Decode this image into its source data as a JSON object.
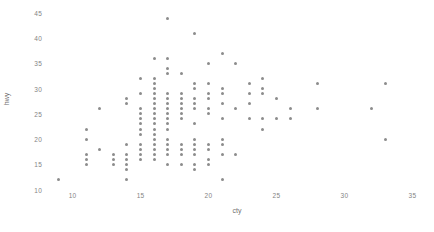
{
  "chart_data": {
    "type": "scatter",
    "title": "",
    "xlabel": "cty",
    "ylabel": "hwy",
    "xlim": [
      8.2,
      36.0
    ],
    "ylim": [
      10.3,
      45.6
    ],
    "xticks": [
      10,
      15,
      20,
      25,
      30,
      35
    ],
    "yticks": [
      10,
      15,
      20,
      25,
      30,
      35,
      40,
      45
    ],
    "xtick_labels": [
      "10",
      "15",
      "20",
      "25",
      "30",
      "35"
    ],
    "ytick_labels": [
      "10",
      "15",
      "20",
      "25",
      "30",
      "35",
      "40",
      "45"
    ],
    "grid": false,
    "legend": "none",
    "point_color": "#8c8c8c",
    "background": "#ffffff",
    "x": [
      18,
      21,
      20,
      21,
      16,
      18,
      18,
      18,
      16,
      20,
      19,
      15,
      17,
      17,
      15,
      15,
      17,
      16,
      14,
      11,
      14,
      13,
      12,
      16,
      15,
      16,
      15,
      15,
      14,
      11,
      11,
      14,
      19,
      22,
      18,
      18,
      17,
      18,
      17,
      16,
      16,
      17,
      17,
      11,
      15,
      15,
      16,
      16,
      15,
      14,
      13,
      14,
      14,
      9,
      11,
      17,
      16,
      14,
      14,
      11,
      11,
      12,
      14,
      15,
      14,
      13,
      13,
      14,
      14,
      13,
      13,
      13,
      11,
      13,
      18,
      17,
      21,
      19,
      19,
      19,
      14,
      15,
      17,
      16,
      16,
      15,
      17,
      26,
      20,
      18,
      16,
      16,
      15,
      19,
      17,
      17,
      17,
      16,
      16,
      17,
      15,
      17,
      16,
      17,
      17,
      18,
      17,
      16,
      16,
      15,
      15,
      14,
      28,
      24,
      25,
      23,
      24,
      26,
      25,
      24,
      21,
      21,
      21,
      21,
      18,
      18,
      19,
      19,
      19,
      20,
      20,
      19,
      20,
      17,
      16,
      17,
      17,
      15,
      15,
      14,
      28,
      24,
      19,
      20,
      18,
      18,
      17,
      17,
      19,
      19,
      17,
      17,
      16,
      16,
      17,
      17,
      15,
      15,
      17,
      16,
      18,
      17,
      19,
      18,
      17,
      19,
      17,
      18,
      16,
      17,
      21,
      33,
      20,
      18,
      21,
      22,
      21,
      21,
      33,
      33,
      32,
      28,
      19,
      21,
      23,
      23,
      19,
      18,
      19,
      19,
      24,
      18,
      20,
      21,
      22,
      18,
      18,
      19,
      21,
      17,
      19,
      15,
      16,
      17,
      15,
      16,
      17,
      16,
      17,
      17,
      17,
      15,
      15,
      18,
      16,
      17,
      17,
      18,
      17,
      19,
      18,
      18,
      18,
      20,
      18,
      20,
      17,
      15,
      15,
      16,
      16,
      18,
      18,
      17,
      16,
      18,
      17,
      21,
      23
    ],
    "y": [
      29,
      29,
      31,
      30,
      26,
      26,
      27,
      26,
      25,
      28,
      27,
      25,
      25,
      25,
      24,
      25,
      23,
      20,
      15,
      20,
      17,
      17,
      26,
      23,
      26,
      25,
      24,
      19,
      14,
      15,
      17,
      27,
      30,
      26,
      29,
      26,
      24,
      24,
      22,
      22,
      24,
      24,
      17,
      22,
      21,
      23,
      23,
      19,
      18,
      17,
      17,
      19,
      19,
      12,
      17,
      15,
      17,
      17,
      12,
      17,
      16,
      18,
      15,
      16,
      12,
      17,
      17,
      16,
      12,
      15,
      16,
      17,
      15,
      17,
      17,
      18,
      17,
      19,
      17,
      19,
      19,
      17,
      17,
      17,
      16,
      16,
      17,
      26,
      25,
      26,
      24,
      21,
      22,
      23,
      22,
      20,
      33,
      32,
      32,
      29,
      32,
      34,
      36,
      36,
      29,
      26,
      27,
      30,
      31,
      26,
      26,
      28,
      26,
      29,
      28,
      27,
      24,
      24,
      24,
      22,
      19,
      20,
      17,
      12,
      19,
      18,
      14,
      15,
      18,
      18,
      15,
      17,
      16,
      18,
      17,
      19,
      19,
      17,
      29,
      27,
      31,
      32,
      27,
      26,
      26,
      25,
      25,
      17,
      17,
      20,
      18,
      26,
      26,
      27,
      28,
      25,
      25,
      24,
      27,
      25,
      26,
      23,
      26,
      26,
      26,
      26,
      25,
      27,
      25,
      27,
      20,
      20,
      19,
      17,
      20,
      17,
      29,
      27,
      31,
      31,
      26,
      26,
      28,
      27,
      29,
      31,
      31,
      26,
      26,
      27,
      30,
      33,
      35,
      37,
      35,
      15,
      18,
      20,
      20,
      22,
      17,
      19,
      18,
      20,
      29,
      26,
      29,
      29,
      24,
      44,
      29,
      26,
      29,
      29,
      29,
      29,
      23,
      24,
      44,
      41,
      29,
      26,
      28,
      29,
      29,
      29,
      28,
      29,
      26,
      26,
      26,
      28,
      26,
      29,
      28,
      27,
      24,
      24,
      24,
      22,
      19,
      20,
      17,
      12,
      19,
      18,
      14,
      15,
      18,
      18,
      15,
      17,
      16,
      18,
      17,
      19,
      19,
      17,
      29,
      27,
      31,
      32,
      27,
      26,
      26,
      25,
      25,
      17,
      17,
      20,
      18,
      26,
      26,
      27,
      28,
      25,
      25,
      24,
      27,
      25,
      26,
      23,
      26,
      26,
      26,
      26,
      25,
      27,
      25,
      27,
      20,
      20,
      19,
      17,
      20,
      17,
      29,
      27,
      31,
      31,
      26,
      26,
      28,
      27,
      29,
      31,
      31,
      26,
      26,
      27,
      30,
      33,
      35,
      37,
      35,
      15,
      18,
      20,
      20,
      22,
      17,
      19,
      18,
      20,
      29,
      26,
      29,
      29,
      24,
      44,
      29,
      26,
      29,
      29,
      29,
      29,
      23,
      24,
      44,
      41,
      29,
      26,
      28,
      29,
      29,
      29,
      28,
      29,
      26,
      26,
      26,
      26,
      29,
      28,
      27,
      24,
      24,
      24,
      22,
      19,
      20,
      17,
      12,
      19,
      18,
      14,
      15,
      18,
      18,
      15,
      17,
      16,
      18,
      17,
      19,
      19,
      17,
      29,
      27,
      31,
      32,
      27,
      26,
      26,
      25,
      25,
      17,
      17,
      20,
      18,
      26,
      26,
      27,
      28,
      25,
      25,
      24,
      27,
      25,
      26,
      23,
      26,
      26,
      26,
      26,
      25,
      27,
      25,
      27,
      20,
      20,
      19,
      17,
      20,
      17,
      29,
      27,
      31,
      31,
      26,
      26,
      28,
      27,
      29,
      31,
      31,
      26,
      26,
      27,
      30,
      33,
      35,
      37,
      35,
      15,
      18,
      20,
      20,
      22,
      17,
      19,
      18,
      20,
      29,
      26,
      29,
      29,
      24,
      44,
      29,
      26,
      29,
      29,
      29,
      29,
      23,
      24,
      44,
      41,
      29,
      26,
      28,
      29,
      29,
      29,
      28,
      29,
      26,
      26,
      26
    ]
  },
  "axes": {
    "x_title": "cty",
    "y_title": "hwy"
  }
}
